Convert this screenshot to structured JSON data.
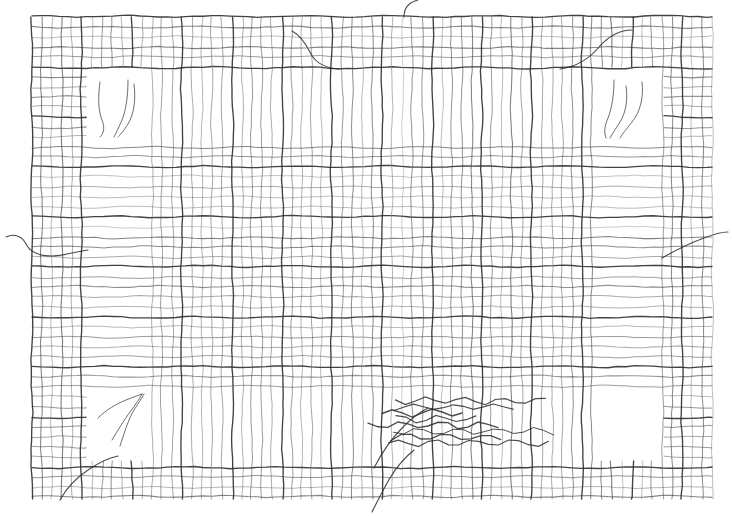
{
  "document": {
    "title": "Woven Mesh Fabric Specimen",
    "kind": "line-drawing",
    "background_color": "#ffffff",
    "width": 732,
    "height": 516
  },
  "canvas": {
    "width": 732,
    "height": 516,
    "margin_left": 32,
    "margin_top": 17,
    "margin_right": 20,
    "margin_bottom": 16
  },
  "mesh": {
    "label": "woven-mesh-grid",
    "x": 32,
    "y": 17,
    "width": 680,
    "height": 483,
    "warp_spacing": 10.0,
    "weft_spacing": 10.0,
    "warp_count": 69,
    "weft_count": 49,
    "thread_color": "#4a4a4a",
    "thread_color_light": "#8a8a8a",
    "thread_width_min": 0.7,
    "thread_width_max": 1.15,
    "heavy_thread_every": 5,
    "heavy_thread_color": "#2d2d2d",
    "heavy_thread_width": 1.35
  },
  "regions": [
    {
      "name": "border-band-top",
      "type": "full-weave",
      "x": 32,
      "y": 17,
      "width": 680,
      "height": 52,
      "description": "dense full weave along the top edge"
    },
    {
      "name": "border-band-bottom",
      "type": "full-weave",
      "x": 32,
      "y": 460,
      "width": 680,
      "height": 40,
      "description": "dense full weave along the bottom edge"
    },
    {
      "name": "border-band-left",
      "type": "full-weave",
      "x": 32,
      "y": 17,
      "width": 56,
      "height": 483,
      "description": "dense full weave along the left edge"
    },
    {
      "name": "border-band-right",
      "type": "full-weave",
      "x": 662,
      "y": 17,
      "width": 50,
      "height": 483,
      "description": "dense full weave along the right edge"
    },
    {
      "name": "warp-only-band-upper",
      "type": "warp-only",
      "x": 148,
      "y": 69,
      "width": 447,
      "height": 70,
      "description": "weft threads withdrawn; only vertical warp threads remain"
    },
    {
      "name": "warp-only-band-lower",
      "type": "warp-only",
      "x": 148,
      "y": 392,
      "width": 447,
      "height": 68,
      "description": "weft threads withdrawn; only vertical warp threads remain"
    },
    {
      "name": "weft-only-band-left",
      "type": "weft-only",
      "x": 88,
      "y": 139,
      "width": 60,
      "height": 253,
      "description": "warp threads withdrawn; only horizontal weft threads remain"
    },
    {
      "name": "weft-only-band-right",
      "type": "weft-only",
      "x": 595,
      "y": 139,
      "width": 67,
      "height": 253,
      "description": "warp threads withdrawn; only horizontal weft threads remain"
    },
    {
      "name": "central-field",
      "type": "full-weave",
      "x": 148,
      "y": 139,
      "width": 447,
      "height": 253,
      "description": "intact square weave in the centre of the specimen"
    }
  ],
  "holes": [
    {
      "name": "hole-top-left",
      "x": 88,
      "y": 68,
      "width": 60,
      "height": 71,
      "frayed_threads": 3
    },
    {
      "name": "hole-top-right",
      "x": 595,
      "y": 68,
      "width": 67,
      "height": 71,
      "frayed_threads": 3
    },
    {
      "name": "hole-bottom-left",
      "x": 88,
      "y": 392,
      "width": 60,
      "height": 68,
      "frayed_threads": 3
    },
    {
      "name": "hole-bottom-right",
      "x": 595,
      "y": 392,
      "width": 67,
      "height": 68,
      "frayed_threads": 0
    }
  ],
  "loose_threads": [
    {
      "name": "loose-thread-top-centre",
      "path": "M 404 17 C 404 6 410 2 418 0",
      "description": "single warp thread trailing off the top edge near centre"
    },
    {
      "name": "loose-thread-top-left-inner",
      "path": "M 292 31 C 300 35 306 44 311 54 C 316 63 324 68 340 69",
      "description": "broken weft curving down into the top band"
    },
    {
      "name": "loose-thread-top-right-inner",
      "path": "M 560 69 C 576 67 590 58 600 46 C 610 35 620 30 632 30",
      "description": "broken weft curving up through the top band"
    },
    {
      "name": "loose-thread-left-edge",
      "path": "M 6 237 C 14 233 22 236 26 244 C 30 252 38 256 52 256 C 62 256 74 252 88 250",
      "description": "thread trailing off the left edge"
    },
    {
      "name": "loose-thread-right-edge",
      "path": "M 662 258 C 676 250 690 243 704 238 C 714 234 722 232 728 232",
      "description": "thread trailing off the right edge"
    },
    {
      "name": "loose-thread-bottom-left",
      "path": "M 60 500 C 66 489 76 478 88 470 C 98 463 108 458 118 456",
      "description": "thread trailing off the bottom-left corner"
    },
    {
      "name": "loose-thread-bottom-centre",
      "path": "M 372 512 C 378 500 384 488 390 478 C 396 468 404 458 414 450",
      "description": "thread trailing off the bottom edge near centre"
    },
    {
      "name": "loose-thread-centre-diagonal",
      "path": "M 374 468 C 382 452 392 438 404 426 C 412 418 420 412 428 408",
      "description": "long diagonal broken thread rising from the bottom band"
    }
  ],
  "fray_zone": {
    "name": "frayed-weft-bundle",
    "x": 382,
    "y": 398,
    "width": 170,
    "height": 48,
    "thread_count": 8,
    "description": "bundle of wavy withdrawn weft threads lying loose over the weave"
  },
  "corner_fray_paths": {
    "top_left": [
      "M 100 82 C 98 96 98 110 102 120 C 105 128 104 133 100 137",
      "M 128 80 C 128 96 126 110 122 120 C 118 129 116 133 114 137",
      "M 134 84 C 136 100 134 114 128 124 C 123 132 120 135 118 137"
    ],
    "top_right": [
      "M 614 80 C 614 94 612 108 608 118 C 604 127 604 133 606 138",
      "M 626 86 C 628 100 626 112 620 122 C 615 130 612 134 610 138",
      "M 642 82 C 644 98 640 112 632 122 C 626 130 622 134 620 138"
    ],
    "bottom_left": [
      "M 98 418 C 106 410 116 404 126 400 C 134 397 139 395 142 394",
      "M 120 446 C 124 434 128 420 134 410 C 139 402 142 398 144 394",
      "M 112 440 C 118 430 124 420 130 412 C 136 404 140 398 142 394"
    ]
  },
  "metrics": {
    "stroke_opacity_light": 0.42,
    "stroke_opacity_normal": 0.72,
    "stroke_opacity_heavy": 0.9
  }
}
